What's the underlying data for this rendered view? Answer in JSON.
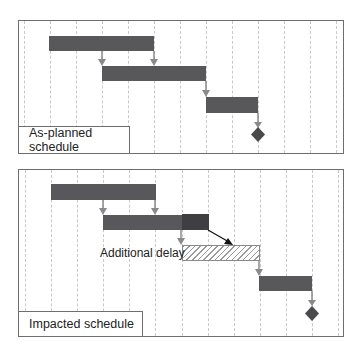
{
  "panels": [
    {
      "title": "As-planned schedule",
      "tasks": [
        {
          "start": 1,
          "end": 5,
          "style": "solid"
        },
        {
          "start": 3,
          "end": 7,
          "style": "solid"
        },
        {
          "start": 7,
          "end": 9,
          "style": "solid"
        }
      ],
      "milestone": {
        "at": 9
      },
      "dependencies": [
        {
          "from_task": 0,
          "to_task": 1,
          "type": "start-to-start"
        },
        {
          "from_task": 0,
          "to_task": 1,
          "type": "finish-to-start"
        },
        {
          "from_task": 1,
          "to_task": 2,
          "type": "finish-to-start"
        },
        {
          "from_task": 2,
          "to": "milestone",
          "type": "finish-to-milestone"
        }
      ]
    },
    {
      "title": "Impacted schedule",
      "tasks": [
        {
          "start": 1,
          "end": 5,
          "style": "solid"
        },
        {
          "start": 3,
          "end": 7,
          "style": "solid",
          "highlight_segment": [
            6,
            7
          ]
        },
        {
          "start": 6,
          "end": 9,
          "style": "hatched",
          "label": "Additional delay"
        },
        {
          "start": 9,
          "end": 11,
          "style": "solid"
        }
      ],
      "milestone": {
        "at": 11
      },
      "delay_annotation": "Additional delay"
    }
  ],
  "colors": {
    "bar": "#58585a",
    "bar_highlight": "#3f3f42",
    "arrow": "#8a8a8a",
    "delay_arrow": "#111111",
    "grid": "#c8c8c8",
    "border": "#6e6e6e"
  }
}
